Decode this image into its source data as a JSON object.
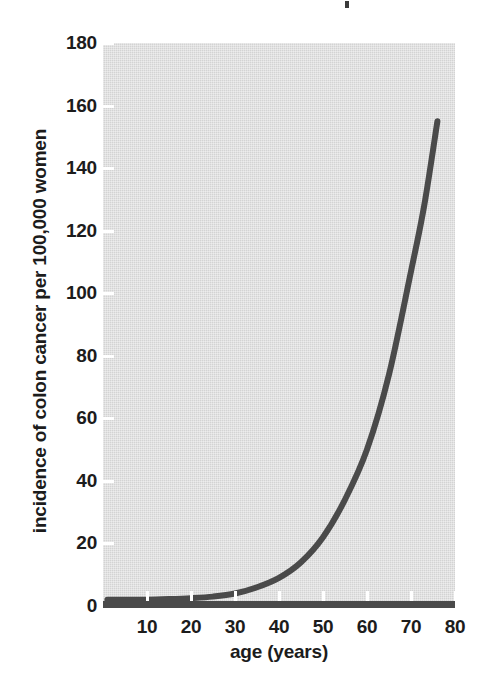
{
  "figure": {
    "background_color": "#ffffff",
    "panel_color": "#d9d9d9",
    "curve_color": "#4a4a4a",
    "tick_color": "#ffffff",
    "text_color": "#1c1c1c"
  },
  "chart_data": {
    "type": "line",
    "title": "",
    "xlabel": "age (years)",
    "ylabel": "incidence of colon cancer per 100,000 women",
    "xlim": [
      0,
      80
    ],
    "ylim": [
      0,
      180
    ],
    "grid": false,
    "legend": null,
    "xticks": [
      10,
      20,
      30,
      40,
      50,
      60,
      70,
      80
    ],
    "xticklabels": [
      "10",
      "20",
      "30",
      "40",
      "50",
      "60",
      "70",
      "80"
    ],
    "yticks": [
      0,
      20,
      40,
      60,
      80,
      100,
      120,
      140,
      160,
      180
    ],
    "yticklabels": [
      "0",
      "20",
      "40",
      "60",
      "80",
      "100",
      "120",
      "140",
      "160",
      "180"
    ],
    "series": [
      {
        "name": "incidence of colon cancer",
        "color": "#4a4a4a",
        "linewidth": 5,
        "x": [
          1,
          5,
          10,
          15,
          20,
          25,
          30,
          35,
          40,
          45,
          50,
          55,
          60,
          65,
          70,
          73,
          76
        ],
        "values": [
          2,
          2,
          2,
          2.2,
          2.5,
          3,
          4,
          6,
          9,
          14,
          22,
          34,
          50,
          74,
          107,
          128,
          155
        ]
      }
    ]
  }
}
